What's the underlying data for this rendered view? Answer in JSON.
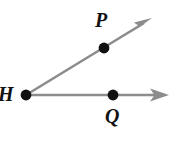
{
  "figure": {
    "kind": "geometry-angle-diagram",
    "width": 180,
    "height": 145,
    "background_color": "#ffffff",
    "ray_color": "#8c8c8c",
    "point_color": "#111111",
    "label_color": "#121212",
    "ray_width": 2.6,
    "point_radius": 5.2
  },
  "labels": {
    "vertex": "H",
    "upper_ray_point": "P",
    "lower_ray_point": "Q"
  },
  "points": [
    {
      "name": "H",
      "x": 26,
      "y": 95,
      "role": "vertex"
    },
    {
      "name": "P",
      "x": 104,
      "y": 48,
      "role": "on-upper-ray"
    },
    {
      "name": "Q",
      "x": 113,
      "y": 95,
      "role": "on-lower-ray"
    }
  ],
  "rays": [
    {
      "name": "ray-HP",
      "from": {
        "x": 26,
        "y": 95
      },
      "through": {
        "x": 104,
        "y": 48
      },
      "arrow_tip": {
        "x": 152,
        "y": 18
      },
      "arrowhead": true
    },
    {
      "name": "ray-HQ",
      "from": {
        "x": 26,
        "y": 95
      },
      "through": {
        "x": 113,
        "y": 95
      },
      "arrow_tip": {
        "x": 169,
        "y": 95
      },
      "arrowhead": true
    }
  ]
}
